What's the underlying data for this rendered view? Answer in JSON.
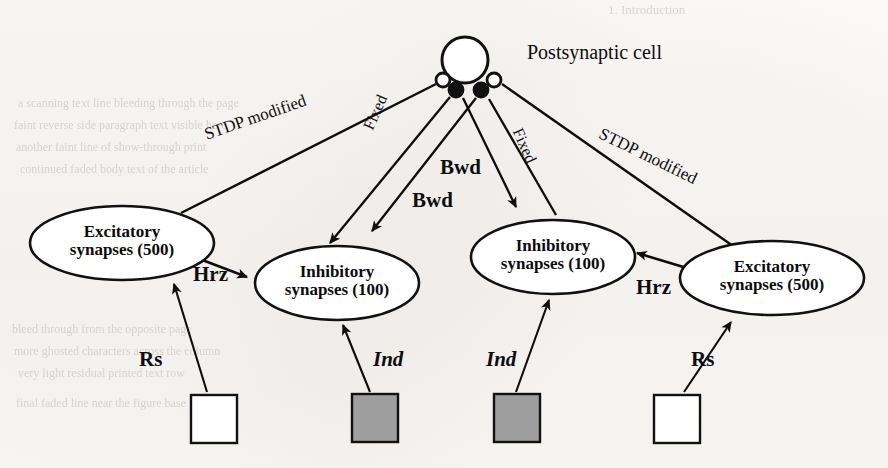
{
  "figure": {
    "title": "Postsynaptic cell",
    "background_color": "#fbfaf8",
    "ink_color": "#111111",
    "shaded_fill": "#9e9e9e",
    "open_fill": "#ffffff"
  },
  "soma": {
    "label": "Postsynaptic cell",
    "cx": 465,
    "cy": 60,
    "r": 23
  },
  "terminals": [
    {
      "name": "left-open-terminal",
      "type": "open",
      "cx": 443,
      "cy": 80,
      "r": 7
    },
    {
      "name": "left-filled-terminal",
      "type": "filled",
      "cx": 456,
      "cy": 90,
      "r": 7
    },
    {
      "name": "right-filled-terminal",
      "type": "filled",
      "cx": 481,
      "cy": 90,
      "r": 7
    },
    {
      "name": "right-open-terminal",
      "type": "open",
      "cx": 494,
      "cy": 80,
      "r": 7
    }
  ],
  "nodes": [
    {
      "id": "exc-left",
      "line1": "Excitatory",
      "line2": "synapses (500)",
      "cx": 122,
      "cy": 243,
      "rx": 92,
      "ry": 37
    },
    {
      "id": "inh-left",
      "line1": "Inhibitory",
      "line2": "synapses (100)",
      "cx": 337,
      "cy": 283,
      "rx": 82,
      "ry": 37
    },
    {
      "id": "inh-right",
      "line1": "Inhibitory",
      "line2": "synapses (100)",
      "cx": 553,
      "cy": 257,
      "rx": 82,
      "ry": 37
    },
    {
      "id": "exc-right",
      "line1": "Excitatory",
      "line2": "synapses (500)",
      "cx": 772,
      "cy": 278,
      "rx": 92,
      "ry": 37
    }
  ],
  "sources": [
    {
      "id": "src-rs-left",
      "fill": "open",
      "x": 191,
      "y": 395,
      "w": 46,
      "h": 48,
      "label": "Rs",
      "label_style": "bold",
      "label_x": 139,
      "label_y": 347
    },
    {
      "id": "src-ind-left",
      "fill": "shaded",
      "x": 352,
      "y": 394,
      "w": 46,
      "h": 48,
      "label": "Ind",
      "label_style": "bolditalic",
      "label_x": 373,
      "label_y": 347
    },
    {
      "id": "src-ind-right",
      "fill": "shaded",
      "x": 494,
      "y": 394,
      "w": 46,
      "h": 48,
      "label": "Ind",
      "label_style": "bolditalic",
      "label_x": 486,
      "label_y": 347
    },
    {
      "id": "src-rs-right",
      "fill": "open",
      "x": 654,
      "y": 395,
      "w": 46,
      "h": 48,
      "label": "Rs",
      "label_style": "bold",
      "label_x": 691,
      "label_y": 347
    }
  ],
  "edge_labels": [
    {
      "id": "stdp-left",
      "text": "STDP modified",
      "style": "plain",
      "x": 205,
      "y": 125,
      "rotate": -19,
      "size": 17
    },
    {
      "id": "fixed-left",
      "text": "Fixed",
      "style": "plain",
      "x": 368,
      "y": 120,
      "rotate": -66,
      "size": 16
    },
    {
      "id": "bwd-upper",
      "text": "Bwd",
      "style": "bold",
      "x": 440,
      "y": 155,
      "rotate": 0,
      "size": 21
    },
    {
      "id": "bwd-lower",
      "text": "Bwd",
      "style": "bold",
      "x": 412,
      "y": 188,
      "rotate": 0,
      "size": 21
    },
    {
      "id": "fixed-right",
      "text": "Fixed",
      "style": "plain",
      "x": 517,
      "y": 120,
      "rotate": 66,
      "size": 16
    },
    {
      "id": "stdp-right",
      "text": "STDP modified",
      "style": "plain",
      "x": 600,
      "y": 123,
      "rotate": 26,
      "size": 17
    },
    {
      "id": "hrz-left",
      "text": "Hrz",
      "style": "bold",
      "x": 193,
      "y": 262,
      "rotate": 0,
      "size": 21
    },
    {
      "id": "hrz-right",
      "text": "Hrz",
      "style": "bold",
      "x": 636,
      "y": 275,
      "rotate": 0,
      "size": 21
    }
  ],
  "connections": [
    {
      "id": "soma-to-exc-left",
      "from": "left-open-terminal",
      "to": "exc-left",
      "kind": "plain-line",
      "relation": "STDP modified"
    },
    {
      "id": "soma-to-inh-left",
      "from": "left-filled-terminal",
      "to": "inh-left",
      "kind": "arrow",
      "relation": "Fixed"
    },
    {
      "id": "soma-to-inh-right",
      "from": "right-filled-terminal",
      "to": "inh-right",
      "kind": "arrow",
      "relation": "Fixed"
    },
    {
      "id": "soma-to-exc-right",
      "from": "right-open-terminal",
      "to": "exc-right",
      "kind": "plain-line",
      "relation": "STDP modified"
    },
    {
      "id": "exc-left-to-inh-left",
      "from": "exc-left",
      "to": "inh-left",
      "kind": "arrow",
      "relation": "Hrz"
    },
    {
      "id": "exc-right-to-inh-right",
      "from": "exc-right",
      "to": "inh-right",
      "kind": "arrow",
      "relation": "Hrz"
    },
    {
      "id": "rs-left-to-exc-left",
      "from": "src-rs-left",
      "to": "exc-left",
      "kind": "arrow",
      "relation": "Rs"
    },
    {
      "id": "ind-left-to-inh-left",
      "from": "src-ind-left",
      "to": "inh-left",
      "kind": "arrow",
      "relation": "Ind"
    },
    {
      "id": "ind-right-to-inh-right",
      "from": "src-ind-right",
      "to": "inh-right",
      "kind": "arrow",
      "relation": "Ind"
    },
    {
      "id": "rs-right-to-exc-right",
      "from": "src-rs-right",
      "to": "exc-right",
      "kind": "arrow",
      "relation": "Rs"
    }
  ],
  "ghost_text": [
    {
      "id": "ghost-heading",
      "text": "1. Introduction",
      "x": 608,
      "y": 2,
      "size": 13
    },
    {
      "id": "ghost-line-1",
      "text": "a scanning text line bleeding through the page",
      "x": 18,
      "y": 96,
      "size": 12
    },
    {
      "id": "ghost-line-2",
      "text": "faint reverse side paragraph text visible here",
      "x": 14,
      "y": 118,
      "size": 12
    },
    {
      "id": "ghost-line-3",
      "text": "another faint line of show-through print",
      "x": 16,
      "y": 140,
      "size": 12
    },
    {
      "id": "ghost-line-4",
      "text": "continued faded body text of the article",
      "x": 20,
      "y": 162,
      "size": 12
    },
    {
      "id": "ghost-line-5",
      "text": "bleed through from the opposite page",
      "x": 12,
      "y": 322,
      "size": 12
    },
    {
      "id": "ghost-line-6",
      "text": "more ghosted characters across the column",
      "x": 14,
      "y": 344,
      "size": 12
    },
    {
      "id": "ghost-line-7",
      "text": "very light residual printed text row",
      "x": 18,
      "y": 366,
      "size": 12
    },
    {
      "id": "ghost-line-8",
      "text": "final faded line near the figure base",
      "x": 16,
      "y": 396,
      "size": 12
    }
  ]
}
